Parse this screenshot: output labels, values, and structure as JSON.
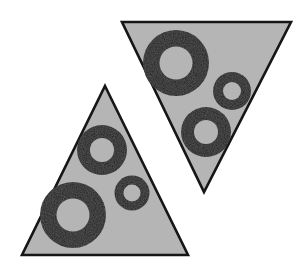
{
  "canvas": {
    "width": 300,
    "height": 280,
    "background_color": "#ffffff",
    "title": "Two shaded triangles each containing three black rings"
  },
  "palette": {
    "triangle_fill": "#b5b5b5",
    "triangle_stroke": "#161616",
    "ring_fill": "#1a1a1a",
    "ring_hole_fill": "#b5b5b5",
    "background": "#ffffff"
  },
  "shapes": {
    "triangles": [
      {
        "id": "triangle-upright",
        "orientation": "upright",
        "points": "105,86 188,255 22,255",
        "stroke_width": 2.6,
        "rings": [
          {
            "id": "ring-upright-large",
            "size_label": "large",
            "cx": 73,
            "cy": 215,
            "outer_r": 33,
            "inner_r": 16.5
          },
          {
            "id": "ring-upright-medium",
            "size_label": "medium",
            "cx": 102,
            "cy": 150,
            "outer_r": 25,
            "inner_r": 12
          },
          {
            "id": "ring-upright-small",
            "size_label": "small",
            "cx": 132,
            "cy": 193,
            "outer_r": 17.5,
            "inner_r": 8.5
          }
        ]
      },
      {
        "id": "triangle-inverted",
        "orientation": "inverted",
        "points": "122,22 291,22 204,192",
        "stroke_width": 2.6,
        "rings": [
          {
            "id": "ring-inverted-large",
            "size_label": "large",
            "cx": 176,
            "cy": 63,
            "outer_r": 33,
            "inner_r": 16.5
          },
          {
            "id": "ring-inverted-small",
            "size_label": "small",
            "cx": 232,
            "cy": 91,
            "outer_r": 19,
            "inner_r": 9
          },
          {
            "id": "ring-inverted-medium",
            "size_label": "medium",
            "cx": 206,
            "cy": 132,
            "outer_r": 25,
            "inner_r": 12
          }
        ]
      }
    ]
  },
  "counts": {
    "triangle_count": 2,
    "rings_per_triangle": 3,
    "total_rings": 6
  }
}
